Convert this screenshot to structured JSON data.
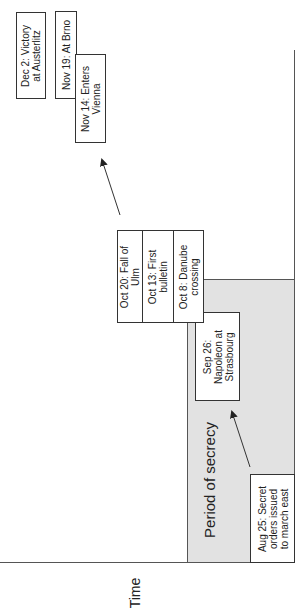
{
  "axis": {
    "label": "Time"
  },
  "region": {
    "label": "Period of secrecy",
    "fill": "#e2e2e2"
  },
  "events": [
    {
      "id": "aug25",
      "line1": "Aug 25: Secret",
      "line2": "orders issued",
      "line3": "to march east"
    },
    {
      "id": "sep26",
      "line1": "Sep 26:",
      "line2": "Napoleon at",
      "line3": "Strasbourg"
    },
    {
      "id": "oct8",
      "line1": "Oct 8: Danube",
      "line2": "crossing"
    },
    {
      "id": "oct13",
      "line1": "Oct 13: First",
      "line2": "bulletin"
    },
    {
      "id": "oct20",
      "line1": "Oct 20: Fall of",
      "line2": "Ulm"
    },
    {
      "id": "nov14",
      "line1": "Nov 14: Enters",
      "line2": "Vienna"
    },
    {
      "id": "nov19",
      "line1": "Nov 19: At Brno"
    },
    {
      "id": "dec2",
      "line1": "Dec 2: Victory",
      "line2": "at Austerlitz"
    }
  ]
}
